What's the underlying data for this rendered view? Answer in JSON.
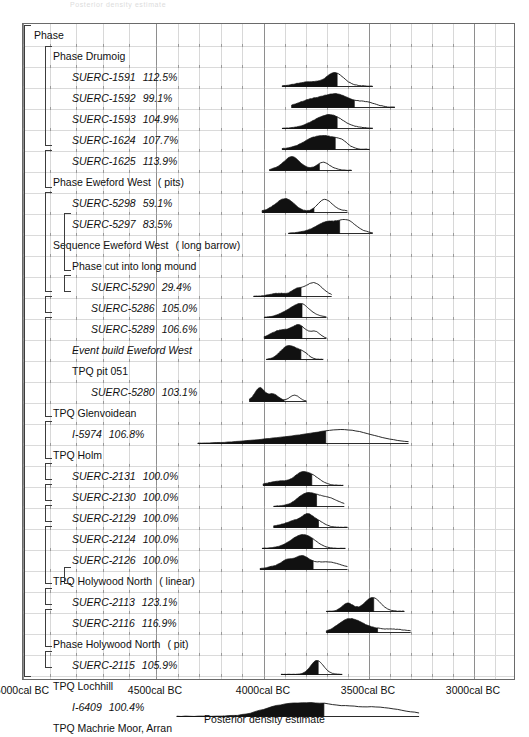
{
  "ghost_text": "Posterior density estimate",
  "axis": {
    "caption": "Posterior density estimate",
    "ticks": [
      {
        "label": "5000cal BC",
        "value": -5000,
        "x": 22
      },
      {
        "label": "4500cal BC",
        "value": -4500,
        "x": 155
      },
      {
        "label": "4000cal BC",
        "value": -4000,
        "x": 263
      },
      {
        "label": "3500cal BC",
        "value": -3500,
        "x": 368
      },
      {
        "label": "3000cal BC",
        "value": -3000,
        "x": 473
      }
    ]
  },
  "chart_data": {
    "type": "area",
    "title": "",
    "xlabel": "Posterior density estimate",
    "ylabel": "",
    "xlim": [
      -5180,
      -2840
    ],
    "grid": true,
    "legend": "none",
    "rows": [
      {
        "n": 0,
        "indent": 0,
        "kind": "group",
        "label": "Phase",
        "suffix": "",
        "pct": ""
      },
      {
        "n": 1,
        "indent": 1,
        "kind": "group",
        "label": "Phase Drumoig",
        "suffix": "",
        "pct": ""
      },
      {
        "n": 2,
        "indent": 2,
        "kind": "item",
        "label": "SUERC-1591",
        "pct": "112.5%",
        "range": [
          -3950,
          -3520
        ],
        "peak": -3710
      },
      {
        "n": 3,
        "indent": 2,
        "kind": "item",
        "label": "SUERC-1592",
        "pct": "99.1%",
        "range": [
          -3905,
          -3415
        ],
        "peak": -3700
      },
      {
        "n": 4,
        "indent": 2,
        "kind": "item",
        "label": "SUERC-1593",
        "pct": "104.9%",
        "range": [
          -3950,
          -3520
        ],
        "peak": -3705
      },
      {
        "n": 5,
        "indent": 2,
        "kind": "item",
        "label": "SUERC-1624",
        "pct": "107.7%",
        "range": [
          -3950,
          -3535
        ],
        "peak": -3720
      },
      {
        "n": 6,
        "indent": 2,
        "kind": "item",
        "label": "SUERC-1625",
        "pct": "113.9%",
        "range": [
          -4010,
          -3620
        ],
        "peak": -3760
      },
      {
        "n": 7,
        "indent": 1,
        "kind": "group",
        "label": "Phase Eweford West",
        "suffix": "( pits)",
        "pct": ""
      },
      {
        "n": 8,
        "indent": 2,
        "kind": "item",
        "label": "SUERC-5298",
        "pct": "59.1%",
        "range": [
          -4045,
          -3640
        ],
        "peak": -3930
      },
      {
        "n": 9,
        "indent": 2,
        "kind": "item",
        "label": "SUERC-5297",
        "pct": "83.5%",
        "range": [
          -3920,
          -3520
        ],
        "peak": -3745
      },
      {
        "n": 10,
        "indent": 1,
        "kind": "group",
        "label": "Sequence Eweford West",
        "suffix": "( long barrow)",
        "pct": ""
      },
      {
        "n": 11,
        "indent": 2,
        "kind": "group",
        "label": "Phase cut into long mound",
        "suffix": "",
        "pct": ""
      },
      {
        "n": 12,
        "indent": 3,
        "kind": "item",
        "label": "SUERC-5290",
        "pct": "29.4%",
        "range": [
          -4085,
          -3715
        ],
        "peak": -3790
      },
      {
        "n": 13,
        "indent": 3,
        "kind": "item",
        "label": "SUERC-5286",
        "pct": "105.0%",
        "range": [
          -4035,
          -3740
        ],
        "peak": -3855
      },
      {
        "n": 14,
        "indent": 3,
        "kind": "item",
        "label": "SUERC-5289",
        "pct": "106.6%",
        "range": [
          -4035,
          -3740
        ],
        "peak": -3855
      },
      {
        "n": 15,
        "indent": 2,
        "kind": "item",
        "label": "Event build Eweford West",
        "pct": "",
        "range": [
          -4025,
          -3755
        ],
        "peak": -3880
      },
      {
        "n": 16,
        "indent": 2,
        "kind": "group",
        "label": "TPQ pit 051",
        "suffix": "",
        "pct": ""
      },
      {
        "n": 17,
        "indent": 3,
        "kind": "item",
        "label": "SUERC-5280",
        "pct": "103.1%",
        "range": [
          -4105,
          -3835
        ],
        "peak": -3990
      },
      {
        "n": 18,
        "indent": 1,
        "kind": "group",
        "label": "TPQ Glenvoidean",
        "suffix": "",
        "pct": ""
      },
      {
        "n": 19,
        "indent": 2,
        "kind": "item",
        "label": "I-5974",
        "pct": "106.8%",
        "range": [
          -4350,
          -3350
        ],
        "peak": -3640
      },
      {
        "n": 20,
        "indent": 1,
        "kind": "group",
        "label": "TPQ Holm",
        "suffix": "",
        "pct": ""
      },
      {
        "n": 21,
        "indent": 2,
        "kind": "item",
        "label": "SUERC-2131",
        "pct": "100.0%",
        "range": [
          -4040,
          -3660
        ],
        "peak": -3860
      },
      {
        "n": 22,
        "indent": 2,
        "kind": "item",
        "label": "SUERC-2130",
        "pct": "100.0%",
        "range": [
          -3990,
          -3655
        ],
        "peak": -3855
      },
      {
        "n": 23,
        "indent": 2,
        "kind": "item",
        "label": "SUERC-2129",
        "pct": "100.0%",
        "range": [
          -3990,
          -3640
        ],
        "peak": -3840
      },
      {
        "n": 24,
        "indent": 2,
        "kind": "item",
        "label": "SUERC-2124",
        "pct": "100.0%",
        "range": [
          -4045,
          -3650
        ],
        "peak": -3855
      },
      {
        "n": 25,
        "indent": 2,
        "kind": "item",
        "label": "SUERC-2126",
        "pct": "100.0%",
        "range": [
          -4055,
          -3640
        ],
        "peak": -3855
      },
      {
        "n": 26,
        "indent": 1,
        "kind": "group",
        "label": "TPQ Holywood North",
        "suffix": "( linear)",
        "pct": ""
      },
      {
        "n": 27,
        "indent": 2,
        "kind": "item",
        "label": "SUERC-2113",
        "pct": "123.1%",
        "range": [
          -3740,
          -3370
        ],
        "peak": -3640
      },
      {
        "n": 28,
        "indent": 2,
        "kind": "item",
        "label": "SUERC-2116",
        "pct": "116.9%",
        "range": [
          -3740,
          -3340
        ],
        "peak": -3640
      },
      {
        "n": 29,
        "indent": 1,
        "kind": "group",
        "label": "Phase Holywood North",
        "suffix": "( pit)",
        "pct": ""
      },
      {
        "n": 30,
        "indent": 2,
        "kind": "item",
        "label": "SUERC-2115",
        "pct": "105.9%",
        "range": [
          -3955,
          -3665
        ],
        "peak": -3790
      },
      {
        "n": 31,
        "indent": 1,
        "kind": "group",
        "label": "TPQ Lochhill",
        "suffix": "",
        "pct": ""
      },
      {
        "n": 32,
        "indent": 2,
        "kind": "item",
        "label": "I-6409",
        "pct": "100.4%",
        "range": [
          -4450,
          -3300
        ],
        "peak": -3800
      },
      {
        "n": 33,
        "indent": 1,
        "kind": "group",
        "label": "TPQ Machrie Moor, Arran",
        "suffix": "",
        "pct": ""
      },
      {
        "n": 34,
        "indent": 2,
        "kind": "item",
        "label": "GU-2321",
        "pct": "93.1%",
        "range": [
          -3955,
          -3510
        ],
        "peak": -3760
      },
      {
        "n": 35,
        "indent": 1,
        "kind": "group",
        "label": "Sequence Maybury",
        "suffix": "",
        "pct": ""
      },
      {
        "n": 36,
        "indent": 2,
        "kind": "item",
        "label": "SUERC-308",
        "pct": "101.7%",
        "range": [
          -3905,
          -3450
        ],
        "peak": -3735
      },
      {
        "n": 37,
        "indent": 2,
        "kind": "group",
        "label": "TPQ lower fill",
        "suffix": "",
        "pct": ""
      },
      {
        "n": 38,
        "indent": 3,
        "kind": "item",
        "label": "SUERC-309",
        "pct": "100.0%",
        "range": [
          -4040,
          -3640
        ],
        "peak": -3830
      },
      {
        "n": 39,
        "indent": 1,
        "kind": "group",
        "label": "TPQ Monamore",
        "suffix": "",
        "pct": ""
      },
      {
        "n": 40,
        "indent": 2,
        "kind": "item",
        "label": "Q-675",
        "pct": "100.2%",
        "range": [
          -4500,
          -3620
        ],
        "peak": -3830
      },
      {
        "n": 41,
        "indent": 1,
        "kind": "group",
        "label": "TPQ Newbridge, Edinburgh",
        "suffix": "",
        "pct": ""
      },
      {
        "n": 42,
        "indent": 2,
        "kind": "item",
        "label": "AA-53693",
        "pct": "100.0%",
        "range": [
          -4160,
          -3680
        ],
        "peak": -3880
      },
      {
        "n": 43,
        "indent": 2,
        "kind": "item",
        "label": "AA-53694",
        "pct": "100.2%",
        "range": [
          -4150,
          -3600
        ],
        "peak": -3810
      },
      {
        "n": 44,
        "indent": 1,
        "kind": "group",
        "label": "TPQ Newton",
        "suffix": "",
        "pct": ""
      },
      {
        "n": 45,
        "indent": 2,
        "kind": "item",
        "label": "GU-1952",
        "pct": "100.3%",
        "range": [
          -4000,
          -3540
        ],
        "peak": -3730
      }
    ]
  },
  "brackets": [
    {
      "name": "bracket-phase",
      "left": 24,
      "top": 25,
      "height": 652
    },
    {
      "name": "bracket-drumoig",
      "left": 45,
      "top": 46,
      "height": 100
    },
    {
      "name": "bracket-eweford-west-pits",
      "left": 45,
      "top": 150,
      "height": 38
    },
    {
      "name": "bracket-sequence-eweford-west",
      "left": 45,
      "top": 192,
      "height": 100
    },
    {
      "name": "bracket-cut-into-long-mound",
      "left": 64,
      "top": 213,
      "height": 58
    },
    {
      "name": "bracket-tpq-pit-051",
      "left": 64,
      "top": 275,
      "height": 17
    },
    {
      "name": "bracket-glenvoidean",
      "left": 45,
      "top": 296,
      "height": 17
    },
    {
      "name": "bracket-holm",
      "left": 45,
      "top": 317,
      "height": 100
    },
    {
      "name": "bracket-holywood-north-linear",
      "left": 45,
      "top": 421,
      "height": 38
    },
    {
      "name": "bracket-holywood-north-pit",
      "left": 45,
      "top": 463,
      "height": 17
    },
    {
      "name": "bracket-lochhill",
      "left": 45,
      "top": 484,
      "height": 17
    },
    {
      "name": "bracket-machrie-moor",
      "left": 45,
      "top": 505,
      "height": 17
    },
    {
      "name": "bracket-sequence-maybury",
      "left": 45,
      "top": 526,
      "height": 58
    },
    {
      "name": "bracket-tpq-lower-fill",
      "left": 64,
      "top": 567,
      "height": 17
    },
    {
      "name": "bracket-monamore",
      "left": 45,
      "top": 588,
      "height": 17
    },
    {
      "name": "bracket-newbridge",
      "left": 45,
      "top": 609,
      "height": 38
    },
    {
      "name": "bracket-newton",
      "left": 45,
      "top": 651,
      "height": 17
    }
  ]
}
